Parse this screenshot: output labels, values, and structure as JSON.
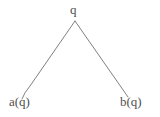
{
  "diagram": {
    "type": "binary-tree",
    "background_color": "#ffffff",
    "edge_color": "#808080",
    "text_color": "#4f4f4f",
    "nodes": [
      {
        "id": "root",
        "label": "q",
        "x": 75,
        "y": 21
      },
      {
        "id": "left",
        "label": "a(q)",
        "x": 22,
        "y": 99
      },
      {
        "id": "right",
        "label": "b(q)",
        "x": 128,
        "y": 97
      }
    ],
    "edges": [
      {
        "from": "root",
        "to": "left",
        "name": "edge-root-to-a"
      },
      {
        "from": "root",
        "to": "right",
        "name": "edge-root-to-b"
      }
    ]
  }
}
